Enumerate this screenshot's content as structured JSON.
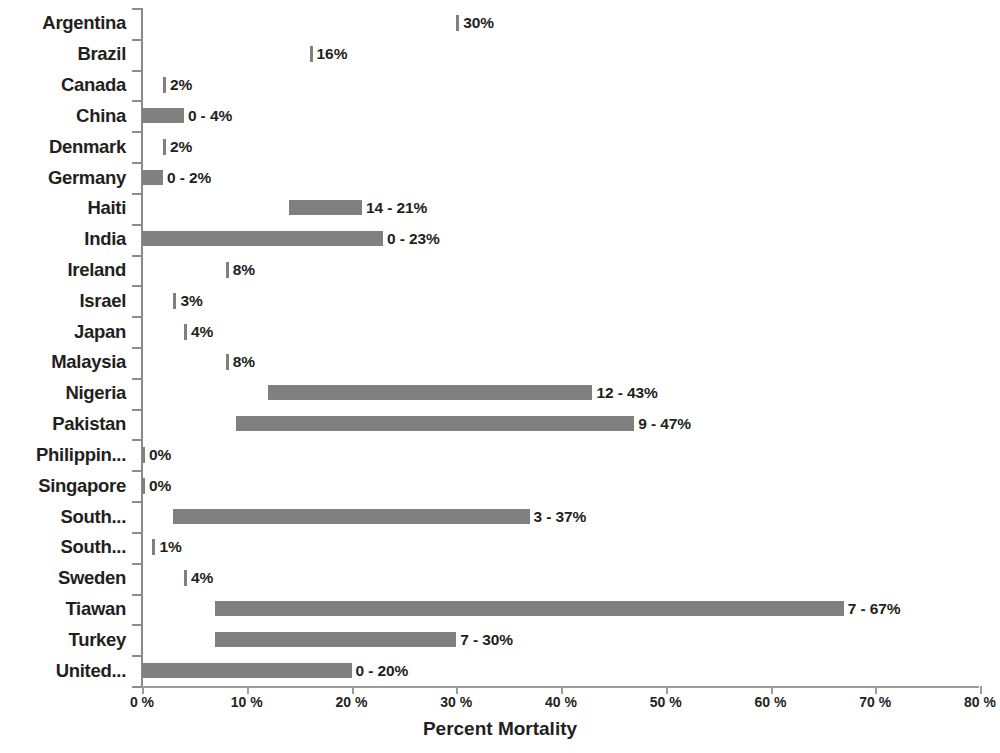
{
  "chart_data": {
    "type": "bar",
    "orientation": "horizontal",
    "title": "",
    "xlabel": "Percent Mortality",
    "ylabel": "",
    "xlim": [
      0,
      80
    ],
    "xticks": [
      0,
      10,
      20,
      30,
      40,
      50,
      60,
      70,
      80
    ],
    "xtick_labels": [
      "0 %",
      "10 %",
      "20 %",
      "30 %",
      "40 %",
      "50 %",
      "60 %",
      "70 %",
      "80 %"
    ],
    "grid": false,
    "legend": false,
    "bar_color": "#808080",
    "text_color": "#231f20",
    "axis_color": "#8a8c8e",
    "categories": [
      "Argentina",
      "Brazil",
      "Canada",
      "China",
      "Denmark",
      "Germany",
      "Haiti",
      "India",
      "Ireland",
      "Israel",
      "Japan",
      "Malaysia",
      "Nigeria",
      "Pakistan",
      "Philippin...",
      "Singapore",
      "South...",
      "South...",
      "Sweden",
      "Tiawan",
      "Turkey",
      "United..."
    ],
    "bars": [
      {
        "category": "Argentina",
        "start": 30,
        "end": 30,
        "label": "30%"
      },
      {
        "category": "Brazil",
        "start": 16,
        "end": 16,
        "label": "16%"
      },
      {
        "category": "Canada",
        "start": 2,
        "end": 2,
        "label": "2%"
      },
      {
        "category": "China",
        "start": 0,
        "end": 4,
        "label": "0 - 4%"
      },
      {
        "category": "Denmark",
        "start": 2,
        "end": 2,
        "label": "2%"
      },
      {
        "category": "Germany",
        "start": 0,
        "end": 2,
        "label": "0 - 2%"
      },
      {
        "category": "Haiti",
        "start": 14,
        "end": 21,
        "label": "14 - 21%"
      },
      {
        "category": "India",
        "start": 0,
        "end": 23,
        "label": "0 - 23%"
      },
      {
        "category": "Ireland",
        "start": 8,
        "end": 8,
        "label": "8%"
      },
      {
        "category": "Israel",
        "start": 3,
        "end": 3,
        "label": "3%"
      },
      {
        "category": "Japan",
        "start": 4,
        "end": 4,
        "label": "4%"
      },
      {
        "category": "Malaysia",
        "start": 8,
        "end": 8,
        "label": "8%"
      },
      {
        "category": "Nigeria",
        "start": 12,
        "end": 43,
        "label": "12 - 43%"
      },
      {
        "category": "Pakistan",
        "start": 9,
        "end": 47,
        "label": "9 - 47%"
      },
      {
        "category": "Philippin...",
        "start": 0,
        "end": 0,
        "label": "0%"
      },
      {
        "category": "Singapore",
        "start": 0,
        "end": 0,
        "label": "0%"
      },
      {
        "category": "South...",
        "start": 3,
        "end": 37,
        "label": "3 - 37%"
      },
      {
        "category": "South...",
        "start": 1,
        "end": 1,
        "label": "1%"
      },
      {
        "category": "Sweden",
        "start": 4,
        "end": 4,
        "label": "4%"
      },
      {
        "category": "Tiawan",
        "start": 7,
        "end": 67,
        "label": "7 - 67%"
      },
      {
        "category": "Turkey",
        "start": 7,
        "end": 30,
        "label": "7 - 30%"
      },
      {
        "category": "United...",
        "start": 0,
        "end": 20,
        "label": "0 - 20%"
      }
    ]
  }
}
